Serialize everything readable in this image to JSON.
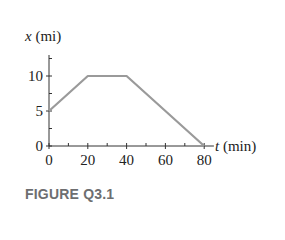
{
  "figure": {
    "caption": "FIGURE Q3.1"
  },
  "colors": {
    "line": "#9a9a9a",
    "axis": "#333333",
    "text": "#222222",
    "caption": "#6d6e70"
  },
  "chart_data": {
    "type": "line",
    "title": "",
    "xlabel": "t (min)",
    "ylabel": "x (mi)",
    "x_label_var": "t",
    "x_label_unit": "(min)",
    "y_label_var": "x",
    "y_label_unit": "(mi)",
    "x": [
      0,
      20,
      40,
      80
    ],
    "series": [
      {
        "name": "position",
        "values": [
          5,
          10,
          10,
          0
        ]
      }
    ],
    "xlim": [
      0,
      85
    ],
    "ylim": [
      0,
      13
    ],
    "x_ticks": [
      0,
      20,
      40,
      60,
      80
    ],
    "x_tick_labels": [
      "0",
      "20",
      "40",
      "60",
      "80"
    ],
    "x_minor_ticks": [
      10,
      30,
      50,
      70
    ],
    "y_ticks": [
      0,
      5,
      10
    ],
    "y_tick_labels": [
      "0",
      "5",
      "10"
    ],
    "y_minor_ticks": [
      2.5,
      7.5,
      12.5
    ],
    "grid": false,
    "legend": "none"
  }
}
